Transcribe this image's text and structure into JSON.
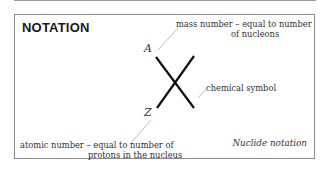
{
  "title": "NOTATION",
  "symbols": {
    "mass": "A",
    "atomic": "Z"
  },
  "labels": {
    "mass_number_line1": "mass number – equal to number",
    "mass_number_line2": "of nucleons",
    "chemical_symbol": "chemical symbol",
    "atomic_number_line1": "atomic number – equal to number of",
    "atomic_number_line2": "protons in the nucleus"
  },
  "caption": "Nuclide notation",
  "colors": {
    "border": "#8c8c8c",
    "cross": "#111111",
    "leader": "#a0a0a0",
    "text": "#333333"
  }
}
